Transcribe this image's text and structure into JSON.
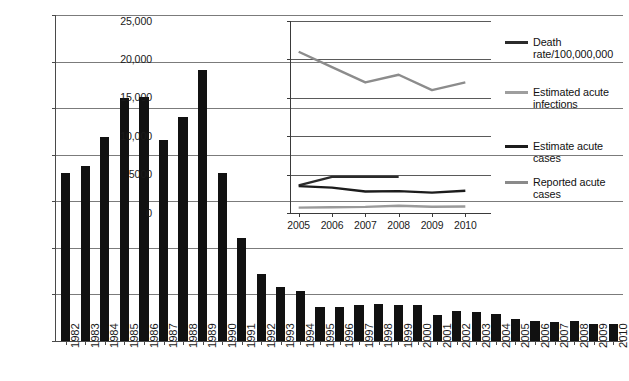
{
  "chart_data": [
    {
      "id": "main",
      "type": "bar",
      "title": "",
      "xlabel": "",
      "ylabel": "",
      "ylim": [
        0,
        350000
      ],
      "yticks": [
        0,
        50000,
        100000,
        150000,
        200000,
        250000,
        300000,
        350000
      ],
      "ytick_labels": [
        "0",
        "50,000",
        "100,000",
        "150,000",
        "200,000",
        "250,000",
        "300,000",
        "350,000"
      ],
      "grid": true,
      "legend": "none",
      "categories": [
        "1982",
        "1983",
        "1984",
        "1985",
        "1986",
        "1987",
        "1988",
        "1989",
        "1990",
        "1991",
        "1992",
        "1993",
        "1994",
        "1995",
        "1996",
        "1997",
        "1998",
        "1999",
        "2000",
        "2001",
        "2002",
        "2003",
        "2004",
        "2005",
        "2006",
        "2007",
        "2008",
        "2009",
        "2010"
      ],
      "values": [
        180000,
        188000,
        219000,
        261000,
        262000,
        216000,
        241000,
        291000,
        180000,
        111000,
        72000,
        58000,
        54000,
        37000,
        37000,
        39000,
        40000,
        39000,
        39000,
        28000,
        32000,
        31000,
        29000,
        24000,
        22000,
        20000,
        21000,
        18000,
        18000
      ],
      "series_name": "Reported acute hepatitis B cases"
    },
    {
      "id": "inset",
      "type": "line",
      "title": "",
      "xlabel": "",
      "ylabel": "",
      "ylim": [
        0,
        25000
      ],
      "yticks": [
        0,
        5000,
        10000,
        15000,
        20000,
        25000
      ],
      "ytick_labels": [
        "0",
        "5000",
        "10,000",
        "15,000",
        "20,000",
        "25,000"
      ],
      "grid": true,
      "legend_position": "right",
      "x": [
        "2005",
        "2006",
        "2007",
        "2008",
        "2009",
        "2010"
      ],
      "series": [
        {
          "name": "Estimated acute infections",
          "color": "#8c8c8c",
          "values": [
            21000,
            19000,
            17000,
            18000,
            16000,
            17000
          ]
        },
        {
          "name": "Estimate acute cases",
          "color": "#2b2b2b",
          "values": [
            3600,
            4700,
            4700,
            4700,
            null,
            null
          ]
        },
        {
          "name": "Death rate/100,000,000",
          "color": "#1c1c1c",
          "values": [
            3500,
            3300,
            2800,
            2850,
            2650,
            2900
          ]
        },
        {
          "name": "Reported acute cases",
          "color": "#9a9a9a",
          "values": [
            700,
            750,
            800,
            950,
            820,
            850
          ]
        }
      ]
    }
  ],
  "main": {
    "y_axis": {
      "ticks": [
        {
          "label": "350,000",
          "value": 350000
        },
        {
          "label": "300,000",
          "value": 300000
        },
        {
          "label": "250,000",
          "value": 250000
        },
        {
          "label": "200,000",
          "value": 200000
        },
        {
          "label": "150,000",
          "value": 150000
        },
        {
          "label": "100,000",
          "value": 100000
        },
        {
          "label": "50,000",
          "value": 50000
        },
        {
          "label": "0",
          "value": 0
        }
      ]
    },
    "bars": [
      {
        "label": "1982",
        "value": 180000
      },
      {
        "label": "1983",
        "value": 188000
      },
      {
        "label": "1984",
        "value": 219000
      },
      {
        "label": "1985",
        "value": 261000
      },
      {
        "label": "1986",
        "value": 262000
      },
      {
        "label": "1987",
        "value": 216000
      },
      {
        "label": "1988",
        "value": 241000
      },
      {
        "label": "1989",
        "value": 291000
      },
      {
        "label": "1990",
        "value": 180000
      },
      {
        "label": "1991",
        "value": 111000
      },
      {
        "label": "1992",
        "value": 72000
      },
      {
        "label": "1993",
        "value": 58000
      },
      {
        "label": "1994",
        "value": 54000
      },
      {
        "label": "1995",
        "value": 37000
      },
      {
        "label": "1996",
        "value": 37000
      },
      {
        "label": "1997",
        "value": 39000
      },
      {
        "label": "1998",
        "value": 40000
      },
      {
        "label": "1999",
        "value": 39000
      },
      {
        "label": "2000",
        "value": 39000
      },
      {
        "label": "2001",
        "value": 28000
      },
      {
        "label": "2002",
        "value": 32000
      },
      {
        "label": "2003",
        "value": 31000
      },
      {
        "label": "2004",
        "value": 29000
      },
      {
        "label": "2005",
        "value": 24000
      },
      {
        "label": "2006",
        "value": 22000
      },
      {
        "label": "2007",
        "value": 20000
      },
      {
        "label": "2008",
        "value": 21000
      },
      {
        "label": "2009",
        "value": 18000
      },
      {
        "label": "2010",
        "value": 18000
      }
    ]
  },
  "inset": {
    "y_axis": {
      "ticks": [
        {
          "label": "25,000",
          "value": 25000
        },
        {
          "label": "20,000",
          "value": 20000
        },
        {
          "label": "15,000",
          "value": 15000
        },
        {
          "label": "10,000",
          "value": 10000
        },
        {
          "label": "5000",
          "value": 5000
        },
        {
          "label": "0",
          "value": 0
        }
      ]
    },
    "x_axis": {
      "ticks": [
        {
          "label": "2005"
        },
        {
          "label": "2006"
        },
        {
          "label": "2007"
        },
        {
          "label": "2008"
        },
        {
          "label": "2009"
        },
        {
          "label": "2010"
        }
      ]
    }
  },
  "legend": {
    "entries": [
      {
        "label": "Death rate/100,000,000",
        "color": "#2b2b2b",
        "thickness": 3
      },
      {
        "label": "Estimated acute infections",
        "color": "#9e9e9e",
        "thickness": 3
      },
      {
        "label": "Estimate acute cases",
        "color": "#1c1c1c",
        "thickness": 3.2
      },
      {
        "label": "Reported acute cases",
        "color": "#8a8a8a",
        "thickness": 3
      }
    ]
  },
  "colors": {
    "bar_fill": "#111111",
    "gridline": "#7b7b7b",
    "axis": "#4a4a4a",
    "background": "#ffffff"
  }
}
